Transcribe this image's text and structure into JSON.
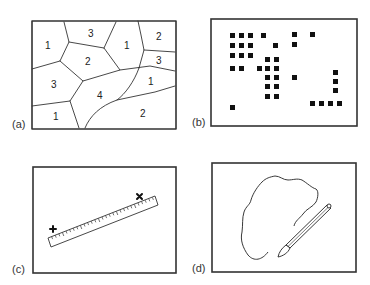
{
  "panels": [
    {
      "id": "a",
      "label": "(a)",
      "description": "Polygon (vector) map with numbered zones",
      "regions": [
        {
          "value": "1",
          "x": 47,
          "y": 45
        },
        {
          "value": "3",
          "x": 90,
          "y": 36
        },
        {
          "value": "1",
          "x": 126,
          "y": 47
        },
        {
          "value": "2",
          "x": 158,
          "y": 39
        },
        {
          "value": "2",
          "x": 87,
          "y": 64
        },
        {
          "value": "3",
          "x": 158,
          "y": 63
        },
        {
          "value": "3",
          "x": 53,
          "y": 88
        },
        {
          "value": "1",
          "x": 150,
          "y": 84
        },
        {
          "value": "4",
          "x": 99,
          "y": 98
        },
        {
          "value": "1",
          "x": 55,
          "y": 120
        },
        {
          "value": "2",
          "x": 142,
          "y": 117
        }
      ]
    },
    {
      "id": "b",
      "label": "(b)",
      "description": "Raster / grid cell representation (filled squares)"
    },
    {
      "id": "c",
      "label": "(c)",
      "description": "Ruler measuring distance between two marked points"
    },
    {
      "id": "d",
      "label": "(d)",
      "description": "Pen tracing an irregular outline"
    }
  ]
}
